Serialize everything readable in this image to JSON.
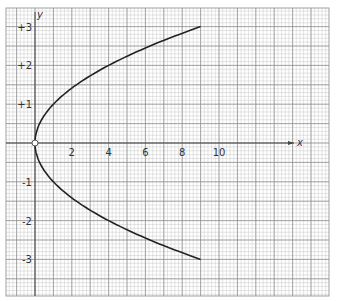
{
  "chart_data": {
    "type": "line",
    "title": "",
    "xlabel": "x",
    "ylabel": "y",
    "equation": "x = y^2",
    "x_ticks": [
      "2",
      "4",
      "6",
      "8",
      "10"
    ],
    "y_ticks": [
      "+3",
      "+2",
      "+1",
      "-1",
      "-2",
      "-3"
    ],
    "xlim": [
      -1.5,
      16
    ],
    "ylim": [
      -3.9,
      3.5
    ],
    "grid": true,
    "legend": null,
    "series": [
      {
        "name": "parabola",
        "x": [
          9,
          6.25,
          4,
          2.25,
          1,
          0.25,
          0,
          0.25,
          1,
          2.25,
          4,
          6.25,
          9
        ],
        "y": [
          3,
          2.5,
          2,
          1.5,
          1,
          0.5,
          0,
          -0.5,
          -1,
          -1.5,
          -2,
          -2.5,
          -3
        ]
      }
    ],
    "annotations": [
      {
        "label": "origin point",
        "x": 0,
        "y": 0,
        "marker": "open-circle"
      }
    ]
  },
  "colors": {
    "grid_minor": "#c8c8c8",
    "grid_major": "#8a8a8a",
    "curve": "#222222",
    "axis": "#444444"
  }
}
